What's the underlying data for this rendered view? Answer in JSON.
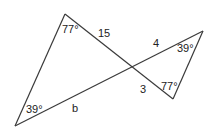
{
  "diagram": {
    "left_triangle": {
      "top_angle": "77°",
      "bottom_angle": "39°",
      "side_top": "15",
      "side_bottom": "b"
    },
    "right_triangle": {
      "top_angle": "39°",
      "bottom_angle": "77°",
      "side_top": "4",
      "side_bottom": "3"
    },
    "colors": {
      "line": "#3a3a3a",
      "text": "#222222",
      "background": "#ffffff"
    }
  }
}
